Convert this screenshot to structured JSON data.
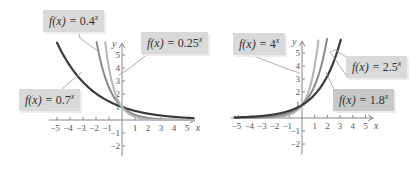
{
  "chart_data": [
    {
      "type": "line",
      "title": "",
      "xlabel": "x",
      "ylabel": "y",
      "xlim": [
        -5,
        5.5
      ],
      "ylim": [
        -2.5,
        6
      ],
      "x_ticks": [
        -5,
        -4,
        -3,
        -2,
        -1,
        1,
        2,
        3,
        4,
        5
      ],
      "y_ticks": [
        -2,
        -1,
        1,
        2,
        3,
        4,
        5
      ],
      "grid": false,
      "series": [
        {
          "name": "f(x) = 0.7^x",
          "base": 0.7,
          "color": "#3a3a3a",
          "label_base": "0.7"
        },
        {
          "name": "f(x) = 0.4^x",
          "base": 0.4,
          "color": "#8a8a8a",
          "label_base": "0.4"
        },
        {
          "name": "f(x) = 0.25^x",
          "base": 0.25,
          "color": "#b5b5b5",
          "label_base": "0.25"
        }
      ]
    },
    {
      "type": "line",
      "title": "",
      "xlabel": "x",
      "ylabel": "y",
      "xlim": [
        -5.5,
        5.5
      ],
      "ylim": [
        -2.5,
        6
      ],
      "x_ticks": [
        -5,
        -4,
        -3,
        -2,
        -1,
        1,
        2,
        3,
        4,
        5
      ],
      "y_ticks": [
        -2,
        -1,
        1,
        2,
        3,
        4,
        5
      ],
      "grid": false,
      "series": [
        {
          "name": "f(x) = 4^x",
          "base": 4,
          "color": "#b5b5b5",
          "label_base": "4"
        },
        {
          "name": "f(x) = 2.5^x",
          "base": 2.5,
          "color": "#8a8a8a",
          "label_base": "2.5"
        },
        {
          "name": "f(x) = 1.8^x",
          "base": 1.8,
          "color": "#3a3a3a",
          "label_base": "1.8"
        }
      ]
    }
  ],
  "labels": {
    "fx": "f(x) = ",
    "exp": "x",
    "left": {
      "a": "0.4",
      "b": "0.25",
      "c": "0.7"
    },
    "right": {
      "a": "4",
      "b": "2.5",
      "c": "1.8"
    }
  },
  "axis": {
    "x": "x",
    "y": "y"
  }
}
